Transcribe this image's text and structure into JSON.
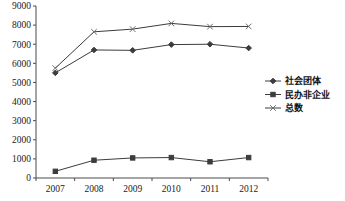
{
  "chart_data": {
    "type": "line",
    "title": "",
    "xlabel": "",
    "ylabel": "",
    "categories": [
      "2007",
      "2008",
      "2009",
      "2010",
      "2011",
      "2012"
    ],
    "ylim": [
      0,
      9000
    ],
    "ytick_labels": [
      "0",
      "1000",
      "2000",
      "3000",
      "4000",
      "5000",
      "6000",
      "7000",
      "8000",
      "9000"
    ],
    "ytick_values": [
      0,
      1000,
      2000,
      3000,
      4000,
      5000,
      6000,
      7000,
      8000,
      9000
    ],
    "grid": false,
    "legend_position": "right",
    "series": [
      {
        "name": "社会团体",
        "marker": "diamond",
        "color": "#3c3c3c",
        "values": [
          5500,
          6700,
          6680,
          6980,
          7000,
          6800
        ]
      },
      {
        "name": "民办非企业",
        "marker": "square",
        "color": "#3c3c3c",
        "values": [
          350,
          930,
          1050,
          1070,
          850,
          1070
        ]
      },
      {
        "name": "总数",
        "marker": "x",
        "color": "#6b6b6b",
        "values": [
          5750,
          7650,
          7790,
          8090,
          7920,
          7930
        ]
      }
    ]
  }
}
